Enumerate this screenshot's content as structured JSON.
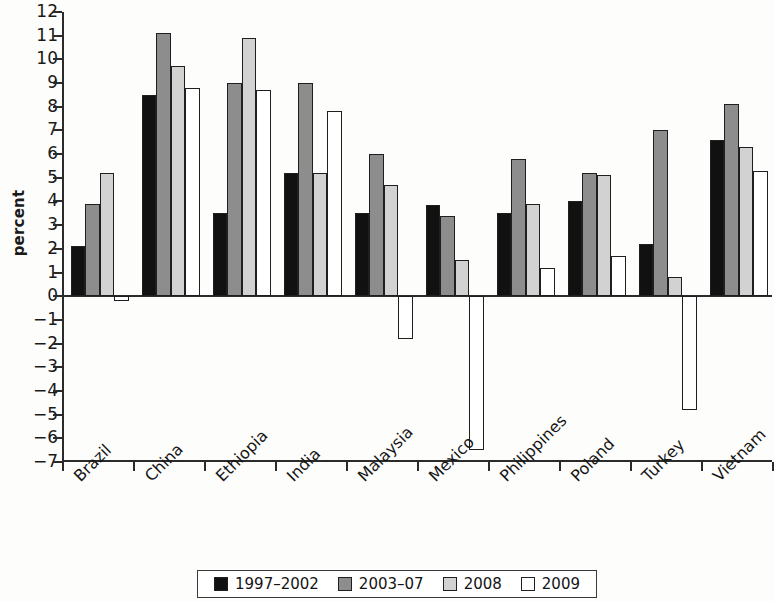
{
  "chart_data": {
    "type": "bar",
    "title": "",
    "subtitle": "",
    "xlabel": "",
    "ylabel": "percent",
    "ylim": [
      -7,
      12
    ],
    "ytick_step": 1,
    "yticks": [
      12,
      11,
      10,
      9,
      8,
      7,
      6,
      5,
      4,
      3,
      2,
      1,
      0,
      "−1",
      "−2",
      "−3",
      "−4",
      "−5",
      "−6",
      "−7"
    ],
    "ytick_values": [
      12,
      11,
      10,
      9,
      8,
      7,
      6,
      5,
      4,
      3,
      2,
      1,
      0,
      -1,
      -2,
      -3,
      -4,
      -5,
      -6,
      -7
    ],
    "grid": false,
    "legend_position": "bottom",
    "categories": [
      "Brazil",
      "China",
      "Ethiopia",
      "India",
      "Malaysia",
      "Mexico",
      "Philippines",
      "Poland",
      "Turkey",
      "Vietnam"
    ],
    "series": [
      {
        "name": "1997–2002",
        "color": "#111111",
        "values": [
          2.1,
          8.5,
          3.5,
          5.2,
          3.5,
          3.85,
          3.5,
          4.0,
          2.2,
          6.6
        ]
      },
      {
        "name": "2003–07",
        "color": "#8d8d8d",
        "values": [
          3.9,
          11.1,
          9.0,
          9.0,
          6.0,
          3.4,
          5.8,
          5.2,
          7.0,
          8.1
        ]
      },
      {
        "name": "2008",
        "color": "#d2d2d2",
        "values": [
          5.2,
          9.7,
          10.9,
          5.2,
          4.7,
          1.55,
          3.9,
          5.1,
          0.8,
          6.3
        ]
      },
      {
        "name": "2009",
        "color": "#ffffff",
        "values": [
          -0.2,
          8.8,
          8.7,
          7.8,
          -1.8,
          -6.5,
          1.2,
          1.7,
          -4.8,
          5.3
        ]
      }
    ]
  },
  "legend": {
    "items": [
      {
        "label": "1997–2002"
      },
      {
        "label": "2003–07"
      },
      {
        "label": "2008"
      },
      {
        "label": "2009"
      }
    ]
  }
}
